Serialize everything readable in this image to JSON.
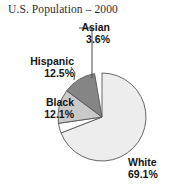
{
  "chart_data": {
    "type": "pie",
    "title": "U.S. Population – 2000",
    "xlabel": "",
    "ylabel": "",
    "legend_position": "none",
    "grid": false,
    "units": "percent",
    "categories": [
      "White",
      "Asian",
      "Hispanic",
      "Black"
    ],
    "values": [
      69.1,
      3.6,
      12.5,
      12.1
    ],
    "labels": [
      "69.1%",
      "3.6%",
      "12.5%",
      "12.1%"
    ],
    "start_angle_deg": 0,
    "direction": "clockwise",
    "slices": [
      {
        "name": "White",
        "value": 69.1,
        "label": "White",
        "percent_label": "69.1%",
        "color": "#ededed",
        "start_deg": 0,
        "end_deg": 248.76
      },
      {
        "name": "Asian",
        "value": 3.6,
        "label": "Asian",
        "percent_label": "3.6%",
        "color": "#fbfbfb",
        "start_deg": 248.76,
        "end_deg": 261.72
      },
      {
        "name": "Hispanic",
        "value": 12.5,
        "label": "Hispanic",
        "percent_label": "12.5%",
        "color": "#c9c9c9",
        "start_deg": 261.72,
        "end_deg": 306.72
      },
      {
        "name": "Black",
        "value": 12.1,
        "label": "Black",
        "percent_label": "12.1%",
        "color": "#858585",
        "start_deg": 306.72,
        "end_deg": 350.28
      }
    ],
    "outline_color": "#555555"
  },
  "figure": {
    "title": "U.S. Population – 2000",
    "background": "#ffffff",
    "labels": {
      "asian": {
        "name": "Asian",
        "percent": "3.6%"
      },
      "hispanic": {
        "name": "Hispanic",
        "percent": "12.5%"
      },
      "black": {
        "name": "Black",
        "percent": "12.1%"
      },
      "white": {
        "name": "White",
        "percent": "69.1%"
      }
    }
  }
}
